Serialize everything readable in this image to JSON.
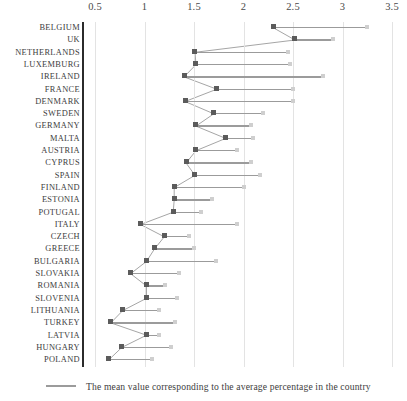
{
  "chart_data": {
    "type": "bar",
    "title": "",
    "xlabel": "",
    "ylabel": "",
    "orientation": "horizontal",
    "xlim": [
      0.3,
      3.55
    ],
    "xticks": [
      0.5,
      1,
      1.5,
      2,
      2.5,
      3,
      3.5
    ],
    "xtick_labels": [
      "0.5",
      "1",
      "1.5",
      "2",
      "2.5",
      "3",
      "3.5"
    ],
    "grid": true,
    "grid_axis": "x",
    "legend_position": "bottom-left",
    "legend": [
      {
        "label": "The mean value corresponding to the average percentage in the country",
        "marker": "line",
        "color": "#9b9b9b"
      }
    ],
    "categories": [
      "BELGIUM",
      "UK",
      "NETHERLANDS",
      "LUXEMBURG",
      "IRELAND",
      "FRANCE",
      "DENMARK",
      "SWEDEN",
      "GERMANY",
      "MALTA",
      "AUSTRIA",
      "CYPRUS",
      "SPAIN",
      "FINLAND",
      "ESTONIA",
      "POTUGAL",
      "ITALY",
      "CZECH",
      "GREECE",
      "BULGARIA",
      "SLOVAKIA",
      "ROMANIA",
      "SLOVENIA",
      "LITHUANIA",
      "TURKEY",
      "LATVIA",
      "HUNGARY",
      "POLAND"
    ],
    "series": [
      {
        "name": "mean value",
        "marker_color": "#5b5b5b",
        "values": [
          2.3,
          2.52,
          1.51,
          1.52,
          1.4,
          1.73,
          1.41,
          1.7,
          1.52,
          1.82,
          1.52,
          1.42,
          1.51,
          1.3,
          1.3,
          1.29,
          0.96,
          1.2,
          1.1,
          1.02,
          0.86,
          1.02,
          1.02,
          0.78,
          0.66,
          1.02,
          0.77,
          0.64
        ]
      },
      {
        "name": "bar end",
        "marker_color": "#cfcfcf",
        "bar_color": "#9b9b9b",
        "values": [
          3.25,
          2.9,
          2.45,
          2.47,
          2.8,
          2.5,
          2.5,
          2.2,
          2.08,
          2.1,
          1.93,
          2.08,
          2.17,
          2.0,
          1.68,
          1.57,
          1.93,
          1.45,
          1.5,
          1.72,
          1.35,
          1.21,
          1.33,
          1.15,
          1.31,
          1.15,
          1.27,
          1.08
        ]
      }
    ]
  }
}
